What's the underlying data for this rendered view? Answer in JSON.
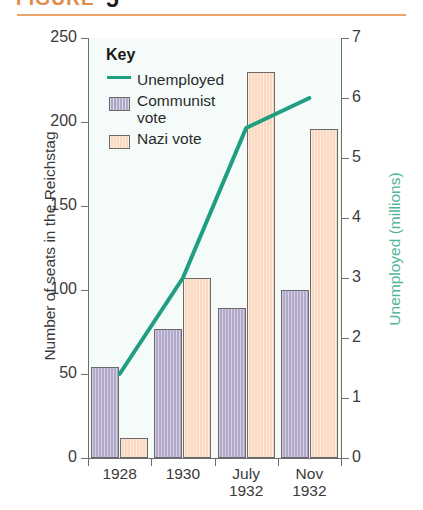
{
  "header": {
    "figure_label": "FIGURE",
    "figure_number": "5",
    "rule_color": "#eba56b"
  },
  "legend": {
    "title": "Key",
    "entries": [
      {
        "label": "Unemployed",
        "swatch": "line",
        "color": "#1f9e80"
      },
      {
        "label": "Communist vote",
        "swatch": "box",
        "color": "#b2a9ca"
      },
      {
        "label": "Nazi vote",
        "swatch": "box",
        "color": "#fbd9c1"
      }
    ]
  },
  "chart_data": {
    "type": "bar",
    "title": "",
    "categories": [
      "1928",
      "1930",
      "July\n1932",
      "Nov\n1932"
    ],
    "category_labels": [
      {
        "line1": "1928",
        "line2": ""
      },
      {
        "line1": "1930",
        "line2": ""
      },
      {
        "line1": "July",
        "line2": "1932"
      },
      {
        "line1": "Nov",
        "line2": "1932"
      }
    ],
    "series": [
      {
        "name": "Communist vote",
        "type": "bar",
        "axis": "left",
        "color": "#b2a9ca",
        "values": [
          54,
          77,
          89,
          100
        ]
      },
      {
        "name": "Nazi vote",
        "type": "bar",
        "axis": "left",
        "color": "#fbd9c1",
        "values": [
          12,
          107,
          230,
          196
        ]
      },
      {
        "name": "Unemployed",
        "type": "line",
        "axis": "right",
        "color": "#1f9e80",
        "values": [
          1.4,
          3.0,
          5.5,
          6.0
        ]
      }
    ],
    "xlabel": "",
    "ylabel": "Number of seats in the Reichstag",
    "ylabel_right": "Unemployed (millions)",
    "ylim": [
      0,
      250
    ],
    "yticks": [
      0,
      50,
      100,
      150,
      200,
      250
    ],
    "ylim_right": [
      0,
      7
    ],
    "yticks_right": [
      0,
      1,
      2,
      3,
      4,
      5,
      6,
      7
    ],
    "grid": false,
    "legend_position": "top-left"
  }
}
